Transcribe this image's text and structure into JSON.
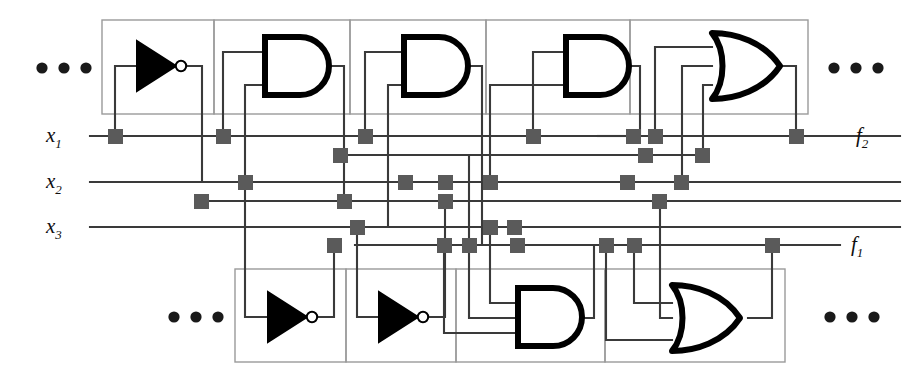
{
  "figure": {
    "kind": "logic-circuit-schematic",
    "colors": {
      "wire": "#3a3a3a",
      "gate_outline": "#000000",
      "cell_border": "#9a9a9a",
      "junction": "#5a5a5a",
      "background": "#ffffff"
    }
  },
  "inputs": [
    {
      "id": "x1",
      "label": "x",
      "sub": "1",
      "y": 136
    },
    {
      "id": "x2",
      "label": "x",
      "sub": "2",
      "y": 182
    },
    {
      "id": "x3",
      "label": "x",
      "sub": "3",
      "y": 227
    }
  ],
  "outputs": [
    {
      "id": "f2",
      "label": "f",
      "sub": "2",
      "y": 132
    },
    {
      "id": "f1",
      "label": "f",
      "sub": "1",
      "y": 245
    }
  ],
  "ellipses": [
    {
      "id": "ellipsis-top-left",
      "x": 40,
      "y": 68,
      "dots": 3
    },
    {
      "id": "ellipsis-top-right",
      "x": 832,
      "y": 68,
      "dots": 3
    },
    {
      "id": "ellipsis-bottom-left",
      "x": 172,
      "y": 317,
      "dots": 3
    },
    {
      "id": "ellipsis-bottom-right",
      "x": 828,
      "y": 317,
      "dots": 3
    }
  ],
  "rows": [
    {
      "id": "top-row",
      "x": 102,
      "y": 20,
      "width": 706,
      "height": 94,
      "cells": [
        {
          "id": "cell-t1",
          "gate": "NOT",
          "x": 102,
          "width": 112
        },
        {
          "id": "cell-t2",
          "gate": "AND",
          "x": 214,
          "width": 136
        },
        {
          "id": "cell-t3",
          "gate": "AND",
          "x": 350,
          "width": 136
        },
        {
          "id": "cell-t4",
          "gate": "AND",
          "x": 486,
          "width": 144
        },
        {
          "id": "cell-t5",
          "gate": "OR",
          "x": 630,
          "width": 178
        }
      ]
    },
    {
      "id": "bottom-row",
      "x": 235,
      "y": 269,
      "width": 550,
      "height": 93,
      "cells": [
        {
          "id": "cell-b1",
          "gate": "NOT",
          "x": 235,
          "width": 111
        },
        {
          "id": "cell-b2",
          "gate": "NOT",
          "x": 346,
          "width": 110
        },
        {
          "id": "cell-b3",
          "gate": "AND",
          "x": 456,
          "width": 149
        },
        {
          "id": "cell-b4",
          "gate": "OR",
          "x": 605,
          "width": 180
        }
      ]
    }
  ],
  "rails": [
    {
      "id": "rail-x1",
      "y": 136,
      "x1": 90,
      "x2": 909
    },
    {
      "id": "rail-a",
      "y": 155,
      "x1": 340,
      "x2": 710
    },
    {
      "id": "rail-x2",
      "y": 182,
      "x1": 90,
      "x2": 909
    },
    {
      "id": "rail-b",
      "y": 201,
      "x1": 200,
      "x2": 909
    },
    {
      "id": "rail-x3",
      "y": 227,
      "x1": 90,
      "x2": 909
    },
    {
      "id": "rail-c",
      "y": 245,
      "x1": 355,
      "x2": 800
    }
  ],
  "gate_counts": {
    "not": 3,
    "and": 4,
    "or": 2,
    "total_cells": 9
  },
  "junction_note": "filled square pads mark programmable crosspoint connections"
}
